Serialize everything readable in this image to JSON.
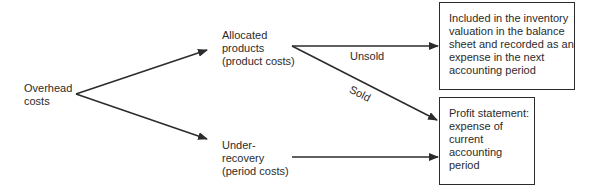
{
  "diagram": {
    "nodes": {
      "overhead": {
        "lines": [
          "Overhead",
          "costs"
        ]
      },
      "allocated": {
        "lines": [
          "Allocated",
          "products",
          "(product costs)"
        ]
      },
      "under": {
        "lines": [
          "Under-",
          "recovery",
          "(period costs)"
        ]
      },
      "inventory_box": {
        "lines": [
          "Included in the inventory",
          "valuation in the balance",
          "sheet and recorded as an",
          "expense in the next",
          "accounting period"
        ]
      },
      "profit_box": {
        "lines": [
          "Profit statement:",
          "expense of",
          "current",
          "accounting",
          "period"
        ]
      }
    },
    "edges": {
      "unsold": "Unsold",
      "sold": "Sold"
    },
    "colors": {
      "line": "#2b2b2b",
      "text": "#2b2b2b",
      "background": "#ffffff"
    }
  }
}
